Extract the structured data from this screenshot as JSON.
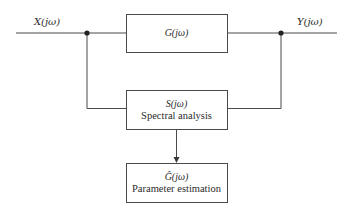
{
  "diagram": {
    "type": "block-diagram",
    "signals": {
      "input_label": "X(jω)",
      "output_label": "Y(jω)"
    },
    "blocks": [
      {
        "id": "system",
        "symbol": "G(jω)",
        "label": ""
      },
      {
        "id": "spectral",
        "symbol": "S(jω)",
        "label": "Spectral analysis"
      },
      {
        "id": "estimation",
        "symbol": "Ĝ(jω)",
        "label": "Parameter estimation"
      }
    ],
    "connections": [
      {
        "from": "input",
        "to": "system"
      },
      {
        "from": "system",
        "to": "output"
      },
      {
        "from": "input-junction",
        "to": "spectral"
      },
      {
        "from": "output-junction",
        "to": "spectral"
      },
      {
        "from": "spectral",
        "to": "estimation",
        "arrow": true
      }
    ],
    "colors": {
      "line": "#4a4a4a",
      "text": "#2b2b2b",
      "background": "#ffffff"
    }
  }
}
